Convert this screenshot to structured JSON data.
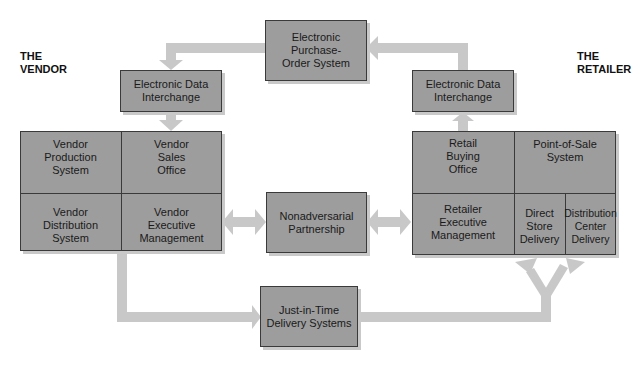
{
  "labels": {
    "vendor": "THE\nVENDOR",
    "retailer": "THE\nRETAILER"
  },
  "nodes": {
    "purchase_order": "Electronic Purchase-\nOrder System",
    "edi_vendor": "Electronic Data\nInterchange",
    "edi_retailer": "Electronic Data\nInterchange",
    "vendor_production": "Vendor\nProduction\nSystem",
    "vendor_sales": "Vendor\nSales\nOffice",
    "vendor_distribution": "Vendor\nDistribution\nSystem",
    "vendor_executive": "Vendor\nExecutive\nManagement",
    "partnership": "Nonadversarial\nPartnership",
    "retail_buying": "Retail\nBuying\nOffice",
    "point_of_sale": "Point-of-Sale\nSystem",
    "retailer_executive": "Retailer\nExecutive\nManagement",
    "direct_store": "Direct\nStore\nDelivery",
    "distribution_center": "Distribution\nCenter\nDelivery",
    "jit": "Just-in-Time\nDelivery Systems"
  },
  "colors": {
    "box_fill": "#9d9d9d",
    "border": "#3a3a3a",
    "arrow": "#c8c8c8",
    "shadow": "#c9c9c9"
  },
  "edges": [
    {
      "from": "Electronic Purchase-Order System",
      "to": "Electronic Data Interchange (Vendor)"
    },
    {
      "from": "Electronic Data Interchange (Vendor)",
      "to": "Vendor Sales Office"
    },
    {
      "from": "Vendor Sales Office",
      "to": "Vendor Production System"
    },
    {
      "from": "Vendor Production System",
      "to": "Vendor Distribution System"
    },
    {
      "from": "Vendor Distribution System",
      "to": "Just-in-Time Delivery Systems"
    },
    {
      "from": "Just-in-Time Delivery Systems",
      "to": "Direct Store Delivery"
    },
    {
      "from": "Just-in-Time Delivery Systems",
      "to": "Distribution Center Delivery"
    },
    {
      "from": "Direct Store Delivery",
      "to": "Point-of-Sale System"
    },
    {
      "from": "Distribution Center Delivery",
      "to": "Point-of-Sale System"
    },
    {
      "from": "Point-of-Sale System",
      "to": "Retail Buying Office"
    },
    {
      "from": "Retail Buying Office",
      "to": "Electronic Data Interchange (Retailer)"
    },
    {
      "from": "Electronic Data Interchange (Retailer)",
      "to": "Electronic Purchase-Order System"
    },
    {
      "from": "Vendor Executive Management",
      "to": "Nonadversarial Partnership",
      "bidirectional": true
    },
    {
      "from": "Nonadversarial Partnership",
      "to": "Retailer Executive Management",
      "bidirectional": true
    }
  ]
}
